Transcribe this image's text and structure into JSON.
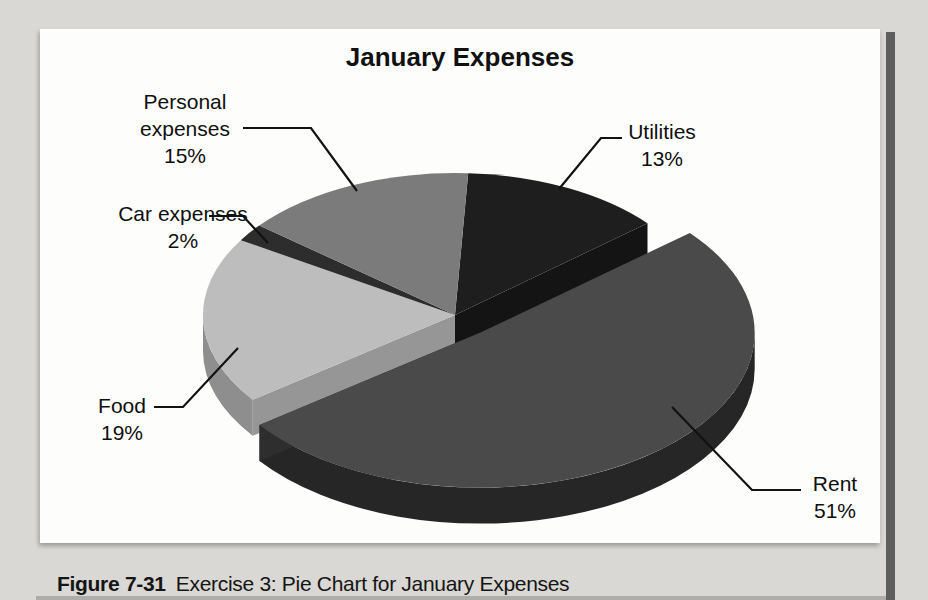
{
  "figure": {
    "caption_label": "Figure 7-31",
    "caption_text": "Exercise 3: Pie Chart for January Expenses"
  },
  "chart_data": {
    "type": "pie",
    "title": "January Expenses",
    "labels": [
      "Utilities",
      "Rent",
      "Food",
      "Car expenses",
      "Personal expenses"
    ],
    "values": [
      13,
      51,
      19,
      2,
      15
    ],
    "unit": "%",
    "legend": "none",
    "style": "3d-exploded-grayscale",
    "exploded_slice": "Rent",
    "slices": [
      {
        "label": "Utilities",
        "pct": 13,
        "color": "#1e1e1e",
        "side": "#0d0d0d",
        "cut": "#141414",
        "exploded": false
      },
      {
        "label": "Rent",
        "pct": 51,
        "color": "#4a4a4a",
        "side": "#262626",
        "cut": "#2e2e2e",
        "exploded": true
      },
      {
        "label": "Food",
        "pct": 19,
        "color": "#bdbdbd",
        "side": "#8e8e8e",
        "cut": "#969696",
        "exploded": false
      },
      {
        "label": "Car expenses",
        "pct": 2,
        "color": "#2d2d2d",
        "side": "#181818",
        "cut": "#222222",
        "exploded": false
      },
      {
        "label": "Personal expenses",
        "pct": 15,
        "color": "#7b7b7b",
        "side": "#565656",
        "cut": "#666666",
        "exploded": false
      }
    ]
  },
  "callouts": {
    "personal": {
      "line1": "Personal",
      "line2": "expenses",
      "line3": "15%"
    },
    "utilities": {
      "line1": "Utilities",
      "line2": "13%"
    },
    "car": {
      "line1": "Car expenses",
      "line2": "2%"
    },
    "food": {
      "line1": "Food",
      "line2": "19%"
    },
    "rent": {
      "line1": "Rent",
      "line2": "51%"
    }
  }
}
